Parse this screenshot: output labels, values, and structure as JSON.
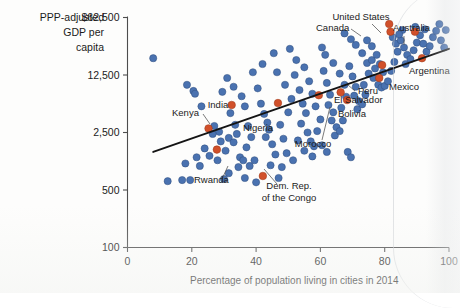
{
  "chart_data": {
    "type": "scatter",
    "title": "",
    "xlabel": "Percentage of population living in cities in 2014",
    "ylabel": "PPP-adjusted GDP per capita",
    "ylabel_lines": [
      "PPP-adjusted",
      "GDP per",
      "capita"
    ],
    "xlim": [
      0,
      100
    ],
    "ylim": [
      100,
      62500
    ],
    "yscale": "log",
    "grid": false,
    "legend": "none",
    "xticks": [
      "0",
      "20",
      "40",
      "60",
      "80",
      "100"
    ],
    "xtick_values": [
      0,
      20,
      40,
      60,
      80,
      100
    ],
    "yticks": [
      "100",
      "500",
      "2,500",
      "12,500",
      "$62,500"
    ],
    "ytick_values": [
      100,
      500,
      2500,
      12500,
      62500
    ],
    "colors": {
      "point": "#4a72b0",
      "highlight": "#d1502a",
      "trendline": "#141414",
      "axis": "#4d4d4d"
    },
    "trendline": {
      "x": [
        8,
        100
      ],
      "y": [
        1450,
        26000
      ]
    },
    "annotations": [
      {
        "label": "United States",
        "x": 81.4,
        "y": 52000,
        "lx": 361,
        "ly": 20,
        "anchor": "middle",
        "leader": [
          [
            372,
            24
          ],
          [
            381,
            33
          ]
        ]
      },
      {
        "label": "Canada",
        "x": 81.8,
        "y": 42000,
        "lx": 316,
        "ly": 31,
        "anchor": "start",
        "leader": [
          [
            351,
            29
          ],
          [
            361,
            36
          ]
        ]
      },
      {
        "label": "Australia",
        "x": 89.4,
        "y": 42000,
        "lx": 393,
        "ly": 31,
        "anchor": "start",
        "leader": [
          [
            404,
            36
          ],
          [
            404,
            45
          ]
        ]
      },
      {
        "label": "Argentina",
        "x": 91.6,
        "y": 20000,
        "lx": 409,
        "ly": 74,
        "anchor": "start",
        "leader": []
      },
      {
        "label": "Mexico",
        "x": 79.2,
        "y": 16500,
        "lx": 389,
        "ly": 90,
        "anchor": "start",
        "leader": []
      },
      {
        "label": "Peru",
        "x": 78.3,
        "y": 11500,
        "lx": 358,
        "ly": 94,
        "anchor": "start",
        "leader": [
          [
            355,
            91
          ],
          [
            348,
            85
          ]
        ]
      },
      {
        "label": "El Salvador",
        "x": 66.3,
        "y": 7700,
        "lx": 334,
        "ly": 103,
        "anchor": "start",
        "leader": []
      },
      {
        "label": "Bolivia",
        "x": 68.3,
        "y": 6200,
        "lx": 338,
        "ly": 117,
        "anchor": "start",
        "leader": []
      },
      {
        "label": "Morocco",
        "x": 59.5,
        "y": 7100,
        "lx": 313,
        "ly": 147,
        "anchor": "middle",
        "leader": [
          [
            322,
            140
          ],
          [
            330,
            107
          ]
        ]
      },
      {
        "label": "Nigeria",
        "x": 46.8,
        "y": 5700,
        "lx": 258,
        "ly": 131,
        "anchor": "middle",
        "leader": []
      },
      {
        "label": "India",
        "x": 32.4,
        "y": 5400,
        "lx": 218,
        "ly": 108,
        "anchor": "middle",
        "leader": []
      },
      {
        "label": "Kenya",
        "x": 25.2,
        "y": 2800,
        "lx": 172,
        "ly": 116,
        "anchor": "start",
        "leader": [
          [
            203,
            114
          ],
          [
            210,
            124
          ]
        ]
      },
      {
        "label": "Rwanda",
        "x": 27.8,
        "y": 1550,
        "lx": 194,
        "ly": 183,
        "anchor": "start",
        "leader": [
          [
            222,
            179
          ],
          [
            228,
            166
          ]
        ]
      },
      {
        "label": "Dem. Rep.",
        "x": 42.1,
        "y": 740,
        "lx": 289,
        "ly": 189,
        "anchor": "middle",
        "leader": [
          [
            277,
            184
          ],
          [
            264,
            169
          ]
        ]
      },
      {
        "label": "of the Congo",
        "x": 42.1,
        "y": 740,
        "lx": 289,
        "ly": 201,
        "anchor": "middle",
        "leader": []
      }
    ],
    "highlighted_points": [
      {
        "name": "United States",
        "x": 81.4,
        "y": 52000
      },
      {
        "name": "Canada",
        "x": 81.8,
        "y": 42000
      },
      {
        "name": "Australia",
        "x": 89.4,
        "y": 42000
      },
      {
        "name": "Argentina",
        "x": 91.6,
        "y": 20000
      },
      {
        "name": "Mexico",
        "x": 79.2,
        "y": 16500
      },
      {
        "name": "Peru",
        "x": 78.3,
        "y": 11500
      },
      {
        "name": "El Salvador",
        "x": 66.3,
        "y": 7700
      },
      {
        "name": "Bolivia",
        "x": 68.3,
        "y": 6200
      },
      {
        "name": "Morocco",
        "x": 59.5,
        "y": 7100
      },
      {
        "name": "Nigeria",
        "x": 46.8,
        "y": 5700
      },
      {
        "name": "India",
        "x": 32.4,
        "y": 5400
      },
      {
        "name": "Kenya",
        "x": 25.2,
        "y": 2800
      },
      {
        "name": "Rwanda",
        "x": 27.8,
        "y": 1550
      },
      {
        "name": "Dem. Rep. of the Congo",
        "x": 42.1,
        "y": 740
      }
    ],
    "points": [
      {
        "x": 8.0,
        "y": 20000
      },
      {
        "x": 18.5,
        "y": 9500
      },
      {
        "x": 20.5,
        "y": 8000
      },
      {
        "x": 21.0,
        "y": 7400
      },
      {
        "x": 23.0,
        "y": 5200
      },
      {
        "x": 27.0,
        "y": 3000
      },
      {
        "x": 28.5,
        "y": 2550
      },
      {
        "x": 26.5,
        "y": 2400
      },
      {
        "x": 29.0,
        "y": 1950
      },
      {
        "x": 24.0,
        "y": 1600
      },
      {
        "x": 21.5,
        "y": 1250
      },
      {
        "x": 18.0,
        "y": 1050
      },
      {
        "x": 12.5,
        "y": 640
      },
      {
        "x": 17.0,
        "y": 660
      },
      {
        "x": 19.5,
        "y": 660
      },
      {
        "x": 22.5,
        "y": 980
      },
      {
        "x": 25.5,
        "y": 1300
      },
      {
        "x": 30.5,
        "y": 1500
      },
      {
        "x": 31.5,
        "y": 2150
      },
      {
        "x": 32.0,
        "y": 4300
      },
      {
        "x": 33.5,
        "y": 3100
      },
      {
        "x": 34.0,
        "y": 2400
      },
      {
        "x": 33.0,
        "y": 1900
      },
      {
        "x": 35.0,
        "y": 1250
      },
      {
        "x": 36.0,
        "y": 1150
      },
      {
        "x": 34.5,
        "y": 950
      },
      {
        "x": 38.0,
        "y": 980
      },
      {
        "x": 39.5,
        "y": 1150
      },
      {
        "x": 37.0,
        "y": 1650
      },
      {
        "x": 38.5,
        "y": 2200
      },
      {
        "x": 37.5,
        "y": 3000
      },
      {
        "x": 36.5,
        "y": 5200
      },
      {
        "x": 35.5,
        "y": 6900
      },
      {
        "x": 33.0,
        "y": 9000
      },
      {
        "x": 31.0,
        "y": 11500
      },
      {
        "x": 29.5,
        "y": 7800
      },
      {
        "x": 40.5,
        "y": 8600
      },
      {
        "x": 41.5,
        "y": 5600
      },
      {
        "x": 42.5,
        "y": 4200
      },
      {
        "x": 43.5,
        "y": 3300
      },
      {
        "x": 44.0,
        "y": 2700
      },
      {
        "x": 43.0,
        "y": 2200
      },
      {
        "x": 45.0,
        "y": 1800
      },
      {
        "x": 46.0,
        "y": 1350
      },
      {
        "x": 44.5,
        "y": 1000
      },
      {
        "x": 48.0,
        "y": 950
      },
      {
        "x": 49.5,
        "y": 1400
      },
      {
        "x": 48.5,
        "y": 2100
      },
      {
        "x": 47.5,
        "y": 3100
      },
      {
        "x": 50.0,
        "y": 4400
      },
      {
        "x": 51.0,
        "y": 6400
      },
      {
        "x": 49.0,
        "y": 9500
      },
      {
        "x": 46.5,
        "y": 13500
      },
      {
        "x": 52.0,
        "y": 12500
      },
      {
        "x": 53.5,
        "y": 8200
      },
      {
        "x": 54.5,
        "y": 5600
      },
      {
        "x": 55.5,
        "y": 4300
      },
      {
        "x": 54.0,
        "y": 3200
      },
      {
        "x": 56.0,
        "y": 2500
      },
      {
        "x": 57.0,
        "y": 1950
      },
      {
        "x": 55.0,
        "y": 1500
      },
      {
        "x": 58.0,
        "y": 1700
      },
      {
        "x": 59.0,
        "y": 2600
      },
      {
        "x": 60.0,
        "y": 3600
      },
      {
        "x": 58.5,
        "y": 5200
      },
      {
        "x": 57.5,
        "y": 7400
      },
      {
        "x": 56.5,
        "y": 10500
      },
      {
        "x": 55.0,
        "y": 15500
      },
      {
        "x": 52.5,
        "y": 19000
      },
      {
        "x": 61.0,
        "y": 14000
      },
      {
        "x": 62.0,
        "y": 10000
      },
      {
        "x": 63.0,
        "y": 7200
      },
      {
        "x": 62.5,
        "y": 5400
      },
      {
        "x": 64.0,
        "y": 4400
      },
      {
        "x": 63.5,
        "y": 3500
      },
      {
        "x": 65.0,
        "y": 2900
      },
      {
        "x": 64.5,
        "y": 2300
      },
      {
        "x": 66.0,
        "y": 2600
      },
      {
        "x": 67.0,
        "y": 3500
      },
      {
        "x": 66.5,
        "y": 5000
      },
      {
        "x": 68.0,
        "y": 6800
      },
      {
        "x": 67.5,
        "y": 9500
      },
      {
        "x": 66.0,
        "y": 13000
      },
      {
        "x": 64.0,
        "y": 17500
      },
      {
        "x": 61.5,
        "y": 22000
      },
      {
        "x": 60.5,
        "y": 27000
      },
      {
        "x": 69.0,
        "y": 16000
      },
      {
        "x": 70.0,
        "y": 12000
      },
      {
        "x": 71.0,
        "y": 9000
      },
      {
        "x": 70.5,
        "y": 7000
      },
      {
        "x": 72.0,
        "y": 6000
      },
      {
        "x": 71.5,
        "y": 4800
      },
      {
        "x": 73.0,
        "y": 5500
      },
      {
        "x": 74.0,
        "y": 7200
      },
      {
        "x": 73.5,
        "y": 9500
      },
      {
        "x": 75.0,
        "y": 13000
      },
      {
        "x": 74.5,
        "y": 17500
      },
      {
        "x": 73.0,
        "y": 23000
      },
      {
        "x": 71.0,
        "y": 29000
      },
      {
        "x": 69.5,
        "y": 34000
      },
      {
        "x": 67.5,
        "y": 40000
      },
      {
        "x": 76.0,
        "y": 19000
      },
      {
        "x": 77.0,
        "y": 15000
      },
      {
        "x": 76.5,
        "y": 11500
      },
      {
        "x": 78.0,
        "y": 9500
      },
      {
        "x": 79.0,
        "y": 8800
      },
      {
        "x": 80.0,
        "y": 9200
      },
      {
        "x": 81.0,
        "y": 10500
      },
      {
        "x": 79.5,
        "y": 13500
      },
      {
        "x": 78.5,
        "y": 17000
      },
      {
        "x": 77.5,
        "y": 22000
      },
      {
        "x": 76.0,
        "y": 28000
      },
      {
        "x": 74.5,
        "y": 33000
      },
      {
        "x": 82.0,
        "y": 14000
      },
      {
        "x": 83.0,
        "y": 18000
      },
      {
        "x": 84.0,
        "y": 24000
      },
      {
        "x": 83.5,
        "y": 30000
      },
      {
        "x": 82.5,
        "y": 36000
      },
      {
        "x": 85.0,
        "y": 33000
      },
      {
        "x": 86.0,
        "y": 27000
      },
      {
        "x": 87.0,
        "y": 22000
      },
      {
        "x": 86.5,
        "y": 17000
      },
      {
        "x": 88.0,
        "y": 19500
      },
      {
        "x": 89.0,
        "y": 25000
      },
      {
        "x": 90.0,
        "y": 31000
      },
      {
        "x": 91.0,
        "y": 38000
      },
      {
        "x": 92.0,
        "y": 30000
      },
      {
        "x": 93.0,
        "y": 24000
      },
      {
        "x": 94.0,
        "y": 28000
      },
      {
        "x": 95.0,
        "y": 36000
      },
      {
        "x": 96.0,
        "y": 43000
      },
      {
        "x": 97.5,
        "y": 33000
      },
      {
        "x": 98.5,
        "y": 27000
      },
      {
        "x": 99.0,
        "y": 44000
      },
      {
        "x": 97.0,
        "y": 52000
      },
      {
        "x": 89.5,
        "y": 48000
      },
      {
        "x": 85.5,
        "y": 44000
      },
      {
        "x": 84.5,
        "y": 39000
      },
      {
        "x": 92.5,
        "y": 45000
      },
      {
        "x": 50.5,
        "y": 26000
      },
      {
        "x": 45.5,
        "y": 23000
      },
      {
        "x": 42.0,
        "y": 17000
      },
      {
        "x": 39.0,
        "y": 13500
      },
      {
        "x": 53.0,
        "y": 2000
      },
      {
        "x": 60.5,
        "y": 1750
      },
      {
        "x": 62.0,
        "y": 1450
      },
      {
        "x": 57.5,
        "y": 1280
      },
      {
        "x": 51.5,
        "y": 1150
      },
      {
        "x": 47.0,
        "y": 700
      },
      {
        "x": 36.5,
        "y": 700
      },
      {
        "x": 31.5,
        "y": 800
      },
      {
        "x": 40.0,
        "y": 620
      },
      {
        "x": 68.5,
        "y": 1450
      },
      {
        "x": 69.5,
        "y": 1250
      },
      {
        "x": 30.0,
        "y": 680
      },
      {
        "x": 28.0,
        "y": 1150
      }
    ]
  }
}
